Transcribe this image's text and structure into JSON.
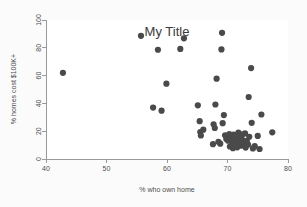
{
  "chart_data": {
    "type": "scatter",
    "title": "My Title",
    "xlabel": "% who own home",
    "ylabel": "% homes cost $100K+",
    "xlim": [
      40,
      80
    ],
    "ylim": [
      0,
      100
    ],
    "xticks": [
      40,
      50,
      60,
      70,
      80
    ],
    "yticks": [
      0,
      20,
      40,
      60,
      80,
      100
    ],
    "xtick_labels": [
      "40",
      "50",
      "60",
      "70",
      "80"
    ],
    "ytick_labels": [
      "0",
      "20",
      "40",
      "60",
      "80",
      "100"
    ],
    "grid": false,
    "legend": null,
    "marker": {
      "shape": "circle",
      "color": "#4a4a4a",
      "size": 3.1
    },
    "series": [
      {
        "name": "states",
        "points": [
          [
            42.8,
            62.0
          ],
          [
            55.7,
            88.6
          ],
          [
            57.7,
            37.0
          ],
          [
            58.5,
            78.6
          ],
          [
            59.1,
            34.8
          ],
          [
            59.9,
            54.2
          ],
          [
            62.2,
            79.2
          ],
          [
            62.8,
            86.8
          ],
          [
            65.1,
            38.6
          ],
          [
            65.4,
            27.2
          ],
          [
            65.5,
            19.4
          ],
          [
            65.6,
            16.9
          ],
          [
            66.0,
            21.1
          ],
          [
            67.6,
            10.7
          ],
          [
            67.7,
            25.0
          ],
          [
            67.9,
            22.3
          ],
          [
            68.0,
            39.2
          ],
          [
            68.2,
            57.8
          ],
          [
            68.5,
            12.4
          ],
          [
            68.8,
            11.0
          ],
          [
            69.0,
            78.8
          ],
          [
            69.1,
            90.8
          ],
          [
            69.2,
            25.8
          ],
          [
            69.4,
            31.6
          ],
          [
            69.6,
            17.0
          ],
          [
            69.8,
            14.4
          ],
          [
            70.0,
            16.2
          ],
          [
            70.1,
            13.2
          ],
          [
            70.3,
            18.0
          ],
          [
            70.4,
            9.0
          ],
          [
            70.6,
            15.0
          ],
          [
            70.8,
            11.6
          ],
          [
            70.9,
            7.8
          ],
          [
            71.0,
            17.6
          ],
          [
            71.2,
            13.8
          ],
          [
            71.3,
            10.0
          ],
          [
            71.5,
            15.6
          ],
          [
            71.6,
            8.4
          ],
          [
            71.8,
            19.0
          ],
          [
            71.9,
            12.0
          ],
          [
            72.0,
            16.4
          ],
          [
            72.2,
            9.6
          ],
          [
            72.4,
            14.0
          ],
          [
            72.5,
            17.8
          ],
          [
            72.7,
            11.4
          ],
          [
            72.9,
            18.4
          ],
          [
            73.0,
            8.2
          ],
          [
            73.2,
            13.0
          ],
          [
            73.4,
            10.4
          ],
          [
            73.5,
            44.6
          ],
          [
            73.6,
            16.0
          ],
          [
            73.9,
            65.4
          ],
          [
            74.0,
            26.0
          ],
          [
            74.2,
            7.6
          ],
          [
            74.5,
            9.2
          ],
          [
            75.0,
            16.6
          ],
          [
            75.3,
            7.2
          ],
          [
            75.6,
            32.0
          ],
          [
            77.4,
            19.2
          ]
        ]
      }
    ]
  }
}
